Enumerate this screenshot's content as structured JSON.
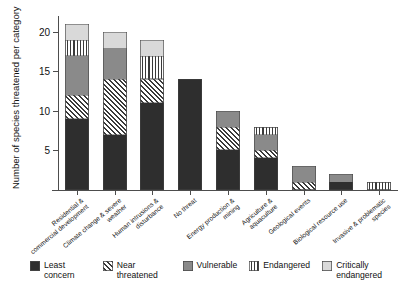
{
  "chart_data": {
    "type": "bar",
    "title": "",
    "xlabel": "",
    "ylabel": "Number of species threatened per category",
    "ylim": [
      0,
      22
    ],
    "yticks": [
      5,
      10,
      15,
      20
    ],
    "grid": false,
    "stacked": true,
    "legend_position": "bottom",
    "categories": [
      "Residential & commercial development",
      "Climate change & severe weather",
      "Human intrusions & disturbance",
      "No threat",
      "Energy production & mining",
      "Agriculture & aquaculture",
      "Geological events",
      "Biological resource use",
      "Invasive & problematic species"
    ],
    "series": [
      {
        "name": "Least concern",
        "pattern": "solid-dark",
        "color": "#2e2e2e",
        "values": [
          9,
          7,
          11,
          14,
          5,
          4,
          0,
          1,
          0
        ]
      },
      {
        "name": "Near threatened",
        "pattern": "diagonal-hatch",
        "color": "#ffffff",
        "values": [
          3,
          7,
          3,
          0,
          3,
          1,
          1,
          0,
          0
        ]
      },
      {
        "name": "Vulnerable",
        "pattern": "solid-gray",
        "color": "#8a8a8a",
        "values": [
          5,
          4,
          0,
          0,
          2,
          2,
          2,
          1,
          0
        ]
      },
      {
        "name": "Endangered",
        "pattern": "vertical-stripes",
        "color": "#ffffff",
        "values": [
          2,
          0,
          3,
          0,
          0,
          1,
          0,
          0,
          1
        ]
      },
      {
        "name": "Critically endangered",
        "pattern": "solid-light",
        "color": "#d9d9d9",
        "values": [
          2,
          2,
          2,
          0,
          0,
          0,
          0,
          0,
          0
        ]
      }
    ],
    "totals": [
      21,
      20,
      19,
      14,
      10,
      8,
      3,
      2,
      1
    ]
  },
  "legend": {
    "items": [
      {
        "label": "Least concern"
      },
      {
        "label": "Near threatened"
      },
      {
        "label": "Vulnerable"
      },
      {
        "label": "Endangered"
      },
      {
        "label": "Critically endangered"
      }
    ]
  }
}
